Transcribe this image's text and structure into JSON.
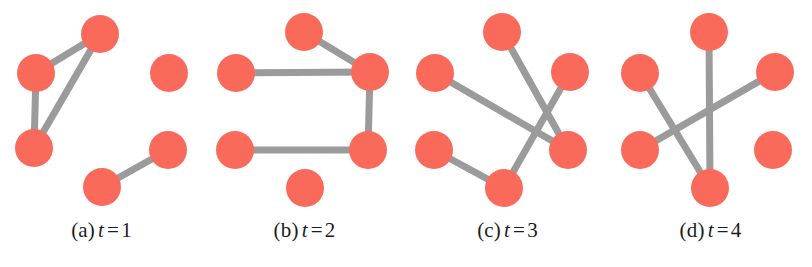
{
  "figure": {
    "width": 812,
    "height": 267,
    "background": "#ffffff",
    "node_color": "#fa6a5a",
    "edge_color": "#9b9b9b",
    "node_radius": 19,
    "edge_width": 7
  },
  "chart_data": {
    "type": "diagram",
    "subtype": "temporal-graph-snapshots",
    "title": "",
    "panel_count": 4,
    "panels": [
      {
        "id": "panel-a",
        "caption_prefix": "(a)",
        "caption_variable": "t",
        "caption_equals": "=",
        "caption_value": "1",
        "caption": "(a) t = 1",
        "node_count": 5,
        "edge_count": 4,
        "nodes": [
          {
            "id": "n1",
            "x": 100,
            "y": 34
          },
          {
            "id": "n2",
            "x": 36,
            "y": 73
          },
          {
            "id": "n3",
            "x": 169,
            "y": 73
          },
          {
            "id": "n4",
            "x": 34,
            "y": 148
          },
          {
            "id": "n5",
            "x": 168,
            "y": 150
          },
          {
            "id": "n6",
            "x": 102,
            "y": 187
          }
        ],
        "edges": [
          {
            "from": "n1",
            "to": "n2"
          },
          {
            "from": "n1",
            "to": "n4"
          },
          {
            "from": "n2",
            "to": "n4"
          },
          {
            "from": "n6",
            "to": "n5"
          }
        ]
      },
      {
        "id": "panel-b",
        "caption_prefix": "(b)",
        "caption_variable": "t",
        "caption_equals": "=",
        "caption_value": "2",
        "caption": "(b) t = 2",
        "node_count": 6,
        "edge_count": 4,
        "nodes": [
          {
            "id": "n1",
            "x": 101,
            "y": 32
          },
          {
            "id": "n2",
            "x": 33,
            "y": 73
          },
          {
            "id": "n3",
            "x": 167,
            "y": 72
          },
          {
            "id": "n4",
            "x": 32,
            "y": 150
          },
          {
            "id": "n5",
            "x": 165,
            "y": 150
          },
          {
            "id": "n6",
            "x": 102,
            "y": 188
          }
        ],
        "edges": [
          {
            "from": "n1",
            "to": "n3"
          },
          {
            "from": "n2",
            "to": "n3"
          },
          {
            "from": "n3",
            "to": "n5"
          },
          {
            "from": "n4",
            "to": "n5"
          }
        ]
      },
      {
        "id": "panel-c",
        "caption_prefix": "(c)",
        "caption_variable": "t",
        "caption_equals": "=",
        "caption_value": "3",
        "caption": "(c) t = 3",
        "node_count": 6,
        "edge_count": 4,
        "nodes": [
          {
            "id": "n1",
            "x": 96,
            "y": 32
          },
          {
            "id": "n2",
            "x": 29,
            "y": 73
          },
          {
            "id": "n3",
            "x": 164,
            "y": 72
          },
          {
            "id": "n4",
            "x": 28,
            "y": 150
          },
          {
            "id": "n5",
            "x": 162,
            "y": 150
          },
          {
            "id": "n6",
            "x": 98,
            "y": 188
          }
        ],
        "edges": [
          {
            "from": "n1",
            "to": "n5"
          },
          {
            "from": "n2",
            "to": "n5"
          },
          {
            "from": "n3",
            "to": "n6"
          },
          {
            "from": "n4",
            "to": "n6"
          }
        ]
      },
      {
        "id": "panel-d",
        "caption_prefix": "(d)",
        "caption_variable": "t",
        "caption_equals": "=",
        "caption_value": "4",
        "caption": "(d) t = 4",
        "node_count": 6,
        "edge_count": 3,
        "nodes": [
          {
            "id": "n1",
            "x": 100,
            "y": 32
          },
          {
            "id": "n2",
            "x": 31,
            "y": 73
          },
          {
            "id": "n3",
            "x": 166,
            "y": 72
          },
          {
            "id": "n4",
            "x": 31,
            "y": 150
          },
          {
            "id": "n5",
            "x": 164,
            "y": 150
          },
          {
            "id": "n6",
            "x": 101,
            "y": 188
          }
        ],
        "edges": [
          {
            "from": "n1",
            "to": "n6"
          },
          {
            "from": "n2",
            "to": "n6"
          },
          {
            "from": "n4",
            "to": "n3"
          }
        ]
      }
    ]
  }
}
